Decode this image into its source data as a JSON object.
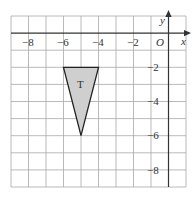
{
  "diagram": {
    "type": "coordinate-grid",
    "x_range": [
      -9,
      1
    ],
    "y_range": [
      -9,
      1
    ],
    "axis_labels": {
      "x": "x",
      "y": "y",
      "origin": "O"
    },
    "x_tick_labels": [
      "−8",
      "−6",
      "−4",
      "−2"
    ],
    "x_tick_values": [
      -8,
      -6,
      -4,
      -2
    ],
    "y_tick_labels": [
      "−2",
      "−4",
      "−6",
      "−8"
    ],
    "y_tick_values": [
      -2,
      -4,
      -6,
      -8
    ],
    "shapes": [
      {
        "name": "T",
        "label": "T",
        "vertices": [
          [
            -6,
            -2
          ],
          [
            -4,
            -2
          ],
          [
            -5,
            -6
          ]
        ],
        "fill": "#cfcfcf",
        "stroke": "#222222"
      }
    ],
    "colors": {
      "grid": "#9a9a9a",
      "axis": "#333333"
    }
  }
}
